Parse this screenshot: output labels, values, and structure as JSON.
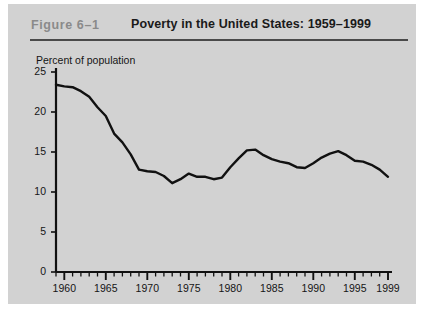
{
  "figure": {
    "number": "Figure 6–1",
    "title": "Poverty in the United States: 1959–1999"
  },
  "colors": {
    "panel_background": "#d2d2d2",
    "page_background": "#ffffff",
    "figure_number_text": "#8a8a8a",
    "title_text": "#1a1a1a",
    "rule": "#4a4a4a",
    "axis": "#111111",
    "data_line": "#111111",
    "tick_label": "#151515"
  },
  "chart_data": {
    "type": "line",
    "title": "Poverty in the United States: 1959–1999",
    "subtitle": "",
    "xlabel": "",
    "ylabel": "Percent of population",
    "ylim": [
      0,
      25
    ],
    "xlim": [
      1959,
      1999
    ],
    "yticks": [
      0,
      5,
      10,
      15,
      20,
      25
    ],
    "ytick_labels": [
      "0",
      "5",
      "10",
      "15",
      "20",
      "25"
    ],
    "xticks": [
      1960,
      1965,
      1970,
      1975,
      1980,
      1985,
      1990,
      1995,
      1999
    ],
    "xtick_labels": [
      "1960",
      "1965",
      "1970",
      "1975",
      "1980",
      "1985",
      "1990",
      "1995",
      "1999"
    ],
    "minor_xtick_interval": 1,
    "grid": false,
    "legend": "none",
    "x": [
      1959,
      1960,
      1961,
      1962,
      1963,
      1964,
      1965,
      1966,
      1967,
      1968,
      1969,
      1970,
      1971,
      1972,
      1973,
      1974,
      1975,
      1976,
      1977,
      1978,
      1979,
      1980,
      1981,
      1982,
      1983,
      1984,
      1985,
      1986,
      1987,
      1988,
      1989,
      1990,
      1991,
      1992,
      1993,
      1994,
      1995,
      1996,
      1997,
      1998,
      1999
    ],
    "series": [
      {
        "name": "Percent of population in poverty",
        "values": [
          23.4,
          23.2,
          23.1,
          22.6,
          21.9,
          20.6,
          19.5,
          17.3,
          16.2,
          14.7,
          12.8,
          12.6,
          12.5,
          12.0,
          11.1,
          11.6,
          12.3,
          11.9,
          11.9,
          11.6,
          11.8,
          13.1,
          14.2,
          15.2,
          15.3,
          14.6,
          14.1,
          13.8,
          13.6,
          13.1,
          13.0,
          13.6,
          14.3,
          14.8,
          15.1,
          14.6,
          13.9,
          13.8,
          13.4,
          12.8,
          11.9
        ]
      }
    ]
  }
}
